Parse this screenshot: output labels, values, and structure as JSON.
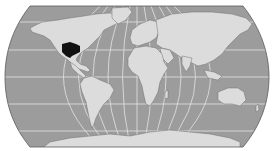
{
  "map": {
    "type": "world-locator-map",
    "projection": "pseudocylindrical (Natural Earth style)",
    "highlighted_region": "central United States",
    "colors": {
      "background": "#ffffff",
      "ocean": "#9c9c9c",
      "land": "#dcdcdc",
      "coast": "#6e6e6e",
      "graticule": "#e6e6e6",
      "frame": "#5a5a5a",
      "highlight": "#111111"
    },
    "graticule": {
      "meridian_step_deg": 30,
      "parallel_step_deg": 20
    }
  }
}
